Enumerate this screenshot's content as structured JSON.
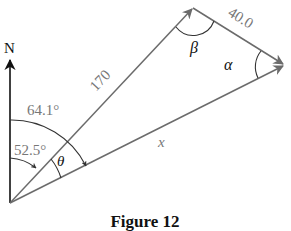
{
  "figure": {
    "caption": "Figure 12",
    "north_label": "N",
    "angles": {
      "bearing_1": "64.1°",
      "bearing_2": "52.5°",
      "theta": "θ",
      "beta": "β",
      "alpha": "α"
    },
    "lengths": {
      "leg_1": "170",
      "leg_2": "40.0",
      "resultant": "x"
    },
    "colors": {
      "line": "#6b6b6b",
      "north_arrow": "#111111",
      "text_gray": "#777777",
      "text_black": "#111111"
    }
  }
}
